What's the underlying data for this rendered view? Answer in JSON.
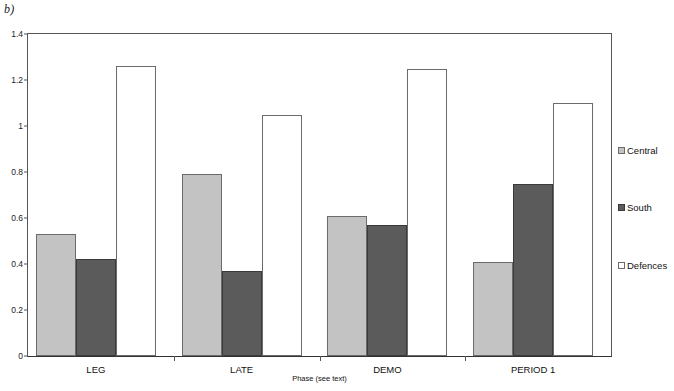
{
  "panel": {
    "label": "b)"
  },
  "chart_data": {
    "type": "bar",
    "title": "",
    "xlabel": "Phase (see text)",
    "ylabel": "",
    "categories": [
      "LEG",
      "LATE",
      "DEMO",
      "PERIOD 1"
    ],
    "series": [
      {
        "name": "Central",
        "color": "#c3c3c3",
        "values": [
          0.53,
          0.79,
          0.61,
          0.41
        ]
      },
      {
        "name": "South",
        "color": "#5b5b5b",
        "values": [
          0.42,
          0.37,
          0.57,
          0.75
        ]
      },
      {
        "name": "Defences",
        "color": "#ffffff",
        "values": [
          1.26,
          1.05,
          1.25,
          1.1
        ]
      }
    ],
    "ylim": [
      0,
      1.4
    ],
    "ytick_values": [
      0,
      0.2,
      0.4,
      0.6,
      0.8,
      1,
      1.2,
      1.4
    ],
    "ytick_labels": [
      "0",
      "0.2",
      "0.4",
      "0.6",
      "0.8",
      "1",
      "1.2",
      "1.4"
    ],
    "grid": false,
    "legend_position": "right",
    "legend_entries": [
      "Central",
      "South",
      "Defences"
    ]
  }
}
